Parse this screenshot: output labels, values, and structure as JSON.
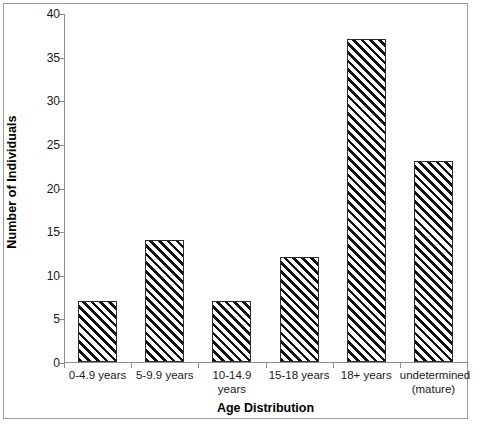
{
  "chart_data": {
    "type": "bar",
    "title": "",
    "xlabel": "Age Distribution",
    "ylabel": "Number of Individuals",
    "categories": [
      "0-4.9 years",
      "5-9.9 years",
      "10-14.9 years",
      "15-18 years",
      "18+ years",
      "undetermined\n(mature)"
    ],
    "category_lines": [
      [
        "0-4.9 years"
      ],
      [
        "5-9.9 years"
      ],
      [
        "10-14.9 years"
      ],
      [
        "15-18 years"
      ],
      [
        "18+ years"
      ],
      [
        "undetermined",
        "(mature)"
      ]
    ],
    "values": [
      7,
      14,
      7,
      12,
      37,
      23
    ],
    "ylim": [
      0,
      40
    ],
    "yticks": [
      0,
      5,
      10,
      15,
      20,
      25,
      30,
      35,
      40
    ],
    "ytick_labels": [
      "0",
      "5",
      "10",
      "15",
      "20",
      "25",
      "30",
      "35",
      "40"
    ],
    "grid": false,
    "legend": null,
    "bar_style": {
      "fill": "diagonal-hatch",
      "hatch_direction": "forward-slash",
      "edge_color": "#2b2b2b",
      "face_color": "#ffffff"
    },
    "axis_color": "#8d8d8d",
    "text_color": "#1a1a1a"
  }
}
